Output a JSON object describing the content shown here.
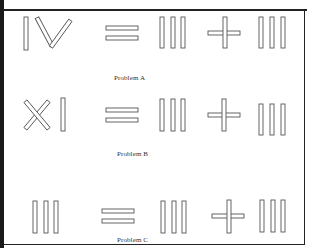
{
  "figure": {
    "problems": [
      {
        "id": "A",
        "label": "Problem A",
        "equation": "IV = III + III",
        "left_numeral": "IV",
        "operator_1": "=",
        "middle_numeral": "III",
        "operator_2": "+",
        "right_numeral": "III"
      },
      {
        "id": "B",
        "label": "Problem B",
        "equation": "XI = III + III",
        "left_numeral": "XI",
        "operator_1": "=",
        "middle_numeral": "III",
        "operator_2": "+",
        "right_numeral": "III"
      },
      {
        "id": "C",
        "label": "Problem C",
        "equation": "III = III + III",
        "left_numeral": "III",
        "operator_1": "=",
        "middle_numeral": "III",
        "operator_2": "+",
        "right_numeral": "III"
      }
    ],
    "colors": {
      "stick_outline": "#555555",
      "frame": "#222222",
      "background": "#ffffff"
    }
  }
}
